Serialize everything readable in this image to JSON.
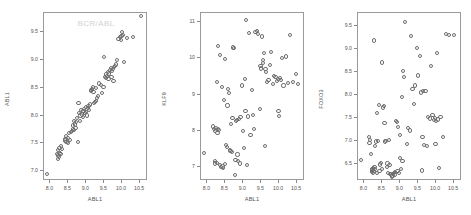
{
  "figure": {
    "background": "#ffffff",
    "marker_color": "#6e6e6e",
    "frame_color": "#9a9a9a",
    "title_color": "#d2d2d2",
    "panel_count": 3
  },
  "chart_data": [
    {
      "type": "scatter",
      "title": "BCR/ABL",
      "xlabel": "ABL1",
      "ylabel": "ABL1",
      "xlim": [
        7.82,
        10.72
      ],
      "ylim": [
        6.82,
        9.85
      ],
      "xticks": [
        8.0,
        8.5,
        9.0,
        9.5,
        10.0,
        10.5
      ],
      "xticklabels": [
        "8.0",
        "8.5",
        "9.0",
        "9.5",
        "10.0",
        "10.5"
      ],
      "yticks": [
        7.0,
        7.5,
        8.0,
        8.5,
        9.0,
        9.5
      ],
      "yticklabels": [
        "7.0",
        "7.5",
        "8.0",
        "8.5",
        "9.0",
        "9.5"
      ],
      "grid": false,
      "legend": "none",
      "x": [
        7.9,
        8.18,
        8.2,
        8.22,
        8.24,
        8.22,
        8.26,
        8.25,
        8.28,
        8.3,
        8.32,
        8.4,
        8.42,
        8.45,
        8.44,
        8.48,
        8.5,
        8.52,
        8.55,
        8.58,
        8.6,
        8.62,
        8.63,
        8.65,
        8.66,
        8.68,
        8.7,
        8.72,
        8.74,
        8.76,
        8.78,
        8.8,
        8.82,
        8.84,
        8.86,
        8.88,
        8.9,
        8.92,
        8.94,
        8.96,
        8.98,
        9.0,
        9.02,
        9.04,
        9.06,
        9.08,
        9.1,
        9.12,
        9.14,
        9.16,
        9.18,
        9.2,
        9.22,
        9.24,
        9.26,
        9.28,
        9.3,
        9.32,
        9.36,
        9.4,
        9.44,
        9.48,
        9.5,
        9.52,
        9.54,
        9.56,
        9.58,
        9.6,
        9.62,
        9.64,
        9.66,
        9.68,
        9.7,
        9.72,
        9.74,
        9.76,
        9.78,
        9.8,
        9.82,
        9.86,
        9.9,
        9.94,
        9.96,
        9.98,
        10.0,
        10.02,
        10.06,
        10.14,
        10.3,
        10.52
      ],
      "y": [
        6.95,
        7.3,
        7.28,
        7.22,
        7.26,
        7.38,
        7.33,
        7.42,
        7.3,
        7.45,
        7.4,
        7.55,
        7.58,
        7.52,
        7.63,
        7.6,
        7.5,
        7.68,
        7.56,
        7.7,
        7.72,
        7.75,
        7.82,
        7.74,
        7.9,
        7.84,
        7.78,
        7.88,
        7.95,
        7.52,
        8.22,
        8.05,
        7.9,
        8.0,
        8.1,
        8.02,
        7.98,
        8.08,
        8.12,
        8.04,
        8.16,
        8.06,
        8.0,
        8.14,
        8.18,
        8.1,
        8.2,
        8.46,
        8.44,
        8.48,
        8.52,
        8.42,
        8.22,
        8.24,
        8.26,
        8.5,
        8.32,
        8.36,
        8.58,
        8.55,
        8.4,
        8.52,
        9.05,
        8.7,
        8.74,
        8.68,
        8.72,
        8.78,
        8.66,
        8.76,
        8.82,
        8.86,
        8.7,
        8.8,
        8.84,
        8.62,
        8.88,
        8.9,
        8.92,
        9.0,
        9.38,
        9.42,
        9.36,
        9.44,
        9.5,
        9.46,
        8.96,
        9.4,
        9.42,
        9.8
      ]
    },
    {
      "type": "scatter",
      "title": "",
      "xlabel": "ABL1",
      "ylabel": "KLF9",
      "xlim": [
        7.82,
        10.72
      ],
      "ylim": [
        6.62,
        11.25
      ],
      "xticks": [
        8.0,
        8.5,
        9.0,
        9.5,
        10.0,
        10.5
      ],
      "xticklabels": [
        "8.0",
        "8.5",
        "9.0",
        "9.5",
        "10.0",
        "10.5"
      ],
      "yticks": [
        7,
        8,
        9,
        10,
        11
      ],
      "yticklabels": [
        "7",
        "8",
        "9",
        "10",
        "11"
      ],
      "grid": false,
      "legend": "none",
      "x": [
        7.9,
        8.16,
        8.18,
        8.2,
        8.22,
        8.22,
        8.24,
        8.26,
        8.26,
        8.28,
        8.3,
        8.3,
        8.32,
        8.34,
        8.36,
        8.38,
        8.4,
        8.42,
        8.44,
        8.46,
        8.48,
        8.5,
        8.52,
        8.54,
        8.56,
        8.58,
        8.6,
        8.62,
        8.64,
        8.66,
        8.68,
        8.7,
        8.72,
        8.74,
        8.76,
        8.78,
        8.8,
        8.82,
        8.84,
        8.86,
        8.88,
        8.9,
        8.92,
        8.96,
        9.0,
        9.02,
        9.04,
        9.06,
        9.08,
        9.1,
        9.12,
        9.16,
        9.2,
        9.24,
        9.28,
        9.3,
        9.34,
        9.38,
        9.42,
        9.46,
        9.48,
        9.5,
        9.52,
        9.54,
        9.56,
        9.58,
        9.6,
        9.62,
        9.64,
        9.66,
        9.7,
        9.74,
        9.78,
        9.82,
        9.86,
        9.9,
        9.94,
        9.96,
        9.98,
        10.0,
        10.02,
        10.04,
        10.08,
        10.12,
        10.18,
        10.24,
        10.3,
        10.38,
        10.46,
        10.52
      ],
      "y": [
        7.4,
        8.12,
        8.05,
        7.1,
        7.18,
        8.0,
        8.08,
        7.12,
        9.35,
        7.95,
        8.05,
        10.35,
        8.02,
        10.1,
        7.05,
        7.0,
        9.2,
        7.02,
        6.98,
        8.85,
        9.98,
        7.08,
        7.62,
        7.55,
        8.7,
        9.15,
        9.05,
        7.48,
        7.45,
        8.2,
        7.42,
        8.35,
        10.3,
        10.28,
        6.78,
        7.2,
        8.28,
        8.3,
        7.35,
        7.18,
        8.32,
        7.1,
        8.38,
        9.25,
        8.0,
        7.52,
        9.42,
        8.55,
        11.05,
        7.05,
        8.4,
        10.7,
        7.88,
        9.12,
        8.45,
        8.05,
        10.72,
        10.75,
        10.68,
        8.6,
        9.8,
        9.72,
        10.6,
        9.88,
        9.95,
        10.15,
        7.58,
        9.7,
        9.62,
        9.35,
        9.4,
        9.82,
        10.18,
        9.3,
        9.52,
        9.48,
        9.38,
        9.42,
        8.55,
        8.42,
        9.45,
        9.4,
        10.02,
        9.25,
        10.05,
        9.32,
        10.65,
        9.35,
        9.58,
        9.3
      ]
    },
    {
      "type": "scatter",
      "title": "",
      "xlabel": "ABL1",
      "ylabel": "FOXO3",
      "xlim": [
        7.82,
        10.72
      ],
      "ylim": [
        6.12,
        9.78
      ],
      "xticks": [
        8.0,
        8.5,
        9.0,
        9.5,
        10.0,
        10.5
      ],
      "xticklabels": [
        "8.0",
        "8.5",
        "9.0",
        "9.5",
        "10.0",
        "10.5"
      ],
      "yticks": [
        6.5,
        7.0,
        7.5,
        8.0,
        8.5,
        9.0,
        9.5
      ],
      "yticklabels": [
        "6.5",
        "7.0",
        "7.5",
        "8.0",
        "8.5",
        "9.0",
        "9.5"
      ],
      "grid": false,
      "legend": "none",
      "x": [
        7.9,
        8.12,
        8.14,
        8.16,
        8.18,
        8.2,
        8.2,
        8.22,
        8.22,
        8.24,
        8.24,
        8.26,
        8.26,
        8.28,
        8.28,
        8.3,
        8.32,
        8.34,
        8.36,
        8.38,
        8.4,
        8.42,
        8.44,
        8.46,
        8.48,
        8.5,
        8.52,
        8.54,
        8.56,
        8.58,
        8.6,
        8.62,
        8.64,
        8.66,
        8.68,
        8.7,
        8.72,
        8.74,
        8.76,
        8.78,
        8.8,
        8.82,
        8.84,
        8.86,
        8.88,
        8.9,
        8.92,
        8.94,
        8.96,
        8.98,
        9.0,
        9.02,
        9.04,
        9.06,
        9.08,
        9.1,
        9.14,
        9.18,
        9.22,
        9.26,
        9.3,
        9.34,
        9.38,
        9.42,
        9.46,
        9.5,
        9.54,
        9.58,
        9.6,
        9.62,
        9.64,
        9.66,
        9.7,
        9.74,
        9.78,
        9.82,
        9.86,
        9.9,
        9.94,
        9.96,
        9.98,
        10.0,
        10.02,
        10.04,
        10.08,
        10.12,
        10.18,
        10.28,
        10.36,
        10.5
      ],
      "y": [
        6.58,
        7.08,
        6.95,
        7.02,
        6.7,
        6.35,
        6.38,
        6.32,
        6.36,
        6.3,
        6.4,
        6.34,
        9.18,
        6.38,
        6.42,
        6.88,
        6.98,
        6.3,
        7.6,
        7.0,
        7.78,
        6.34,
        6.48,
        6.52,
        6.38,
        8.7,
        7.72,
        7.75,
        7.38,
        6.98,
        7.0,
        6.42,
        6.5,
        6.3,
        7.02,
        6.46,
        6.28,
        6.26,
        6.22,
        6.24,
        6.28,
        6.3,
        6.26,
        6.32,
        7.42,
        7.4,
        6.34,
        7.3,
        6.3,
        6.62,
        7.12,
        6.38,
        7.95,
        6.55,
        8.52,
        8.38,
        9.58,
        6.92,
        7.28,
        7.22,
        9.28,
        8.12,
        7.8,
        8.2,
        9.02,
        8.42,
        8.85,
        8.05,
        6.35,
        7.08,
        8.08,
        6.9,
        8.08,
        6.88,
        7.52,
        7.48,
        8.62,
        7.55,
        7.45,
        7.5,
        6.92,
        7.42,
        8.9,
        7.46,
        6.4,
        7.52,
        7.08,
        9.32,
        9.3,
        9.3
      ]
    }
  ]
}
